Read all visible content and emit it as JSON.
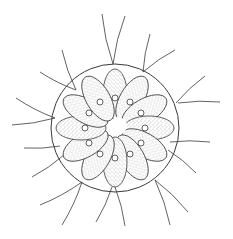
{
  "figure": {
    "style": "stippled pen-and-ink line drawing",
    "colors": {
      "background": "#ffffff",
      "ink": "#3a3a3a",
      "stipple": "#6a6a6a"
    },
    "colony": {
      "center": [
        115,
        128
      ],
      "sheath_radius": 64,
      "cell_count": 12
    },
    "flagella": [
      [
        [
          113,
          64
        ],
        [
          102,
          14
        ]
      ],
      [
        [
          113,
          64
        ],
        [
          125,
          16
        ]
      ],
      [
        [
          143,
          72
        ],
        [
          150,
          34
        ]
      ],
      [
        [
          143,
          72
        ],
        [
          175,
          50
        ]
      ],
      [
        [
          76,
          90
        ],
        [
          62,
          50
        ]
      ],
      [
        [
          76,
          90
        ],
        [
          40,
          72
        ]
      ],
      [
        [
          176,
          103
        ],
        [
          205,
          76
        ]
      ],
      [
        [
          178,
          103
        ],
        [
          220,
          102
        ]
      ],
      [
        [
          55,
          118
        ],
        [
          16,
          98
        ]
      ],
      [
        [
          55,
          118
        ],
        [
          12,
          125
        ]
      ],
      [
        [
          170,
          142
        ],
        [
          210,
          142
        ]
      ],
      [
        [
          168,
          150
        ],
        [
          196,
          173
        ]
      ],
      [
        [
          60,
          146
        ],
        [
          24,
          148
        ]
      ],
      [
        [
          64,
          155
        ],
        [
          32,
          177
        ]
      ],
      [
        [
          82,
          182
        ],
        [
          40,
          205
        ]
      ],
      [
        [
          82,
          182
        ],
        [
          62,
          225
        ]
      ],
      [
        [
          112,
          187
        ],
        [
          96,
          222
        ]
      ],
      [
        [
          115,
          187
        ],
        [
          125,
          226
        ]
      ],
      [
        [
          155,
          180
        ],
        [
          170,
          225
        ]
      ],
      [
        [
          155,
          180
        ],
        [
          188,
          212
        ]
      ]
    ]
  }
}
